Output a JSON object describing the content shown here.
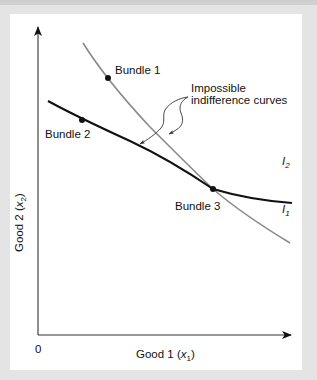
{
  "figure": {
    "type": "indifference-curves-diagram",
    "background_color": "#e4e4e4",
    "panel_color": "#ffffff",
    "axes": {
      "origin_label": "0",
      "x_axis": {
        "label_main": "Good 1 (",
        "label_var": "x",
        "label_sub": "1",
        "label_close": ")"
      },
      "y_axis": {
        "label_main": "Good 2 (",
        "label_var": "x",
        "label_sub": "2",
        "label_close": ")"
      }
    },
    "curves": [
      {
        "id": "I1",
        "label_main": "I",
        "label_sub": "1",
        "color": "#8a8a8a",
        "description": "steeper gray indifference curve"
      },
      {
        "id": "I2",
        "label_main": "I",
        "label_sub": "2",
        "color": "#111111",
        "description": "flatter black indifference curve"
      }
    ],
    "points": [
      {
        "label": "Bundle 1",
        "on_curve": "I1"
      },
      {
        "label": "Bundle 2",
        "on_curve": "I2"
      },
      {
        "label": "Bundle 3",
        "on_curve": "I1 and I2 (intersection)"
      }
    ],
    "annotation": {
      "line1": "Impossible",
      "line2": "indifference curves"
    }
  }
}
